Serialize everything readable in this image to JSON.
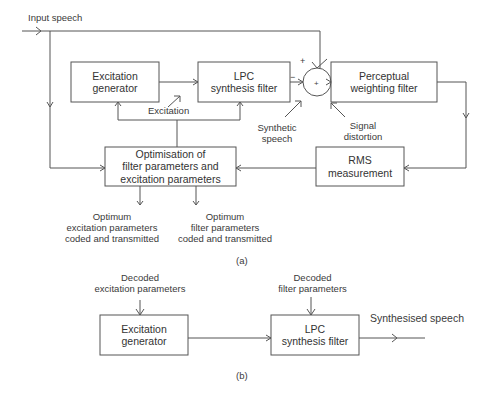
{
  "diagram": {
    "part_a": {
      "caption": "(a)",
      "input_label": "Input speech",
      "boxes": {
        "excitation_generator": [
          "Excitation",
          "generator"
        ],
        "lpc_filter": [
          "LPC",
          "synthesis filter"
        ],
        "perceptual_filter": [
          "Perceptual",
          "weighting filter"
        ],
        "optimisation": [
          "Optimisation of",
          "filter parameters and",
          "excitation parameters"
        ],
        "rms": [
          "RMS",
          "measurement"
        ]
      },
      "summer": {
        "plus_top": "+",
        "minus_left": "−",
        "center": "+"
      },
      "labels": {
        "excitation": "Excitation",
        "synthetic_speech": [
          "Synthetic",
          "speech"
        ],
        "signal_distortion": [
          "Signal",
          "distortion"
        ],
        "optimum_excitation": [
          "Optimum",
          "excitation parameters",
          "coded and transmitted"
        ],
        "optimum_filter": [
          "Optimum",
          "filter parameters",
          "coded and transmitted"
        ]
      }
    },
    "part_b": {
      "caption": "(b)",
      "boxes": {
        "excitation_generator": [
          "Excitation",
          "generator"
        ],
        "lpc_filter": [
          "LPC",
          "synthesis filter"
        ]
      },
      "labels": {
        "decoded_excitation": [
          "Decoded",
          "excitation parameters"
        ],
        "decoded_filter": [
          "Decoded",
          "filter parameters"
        ],
        "output": "Synthesised speech"
      }
    }
  }
}
